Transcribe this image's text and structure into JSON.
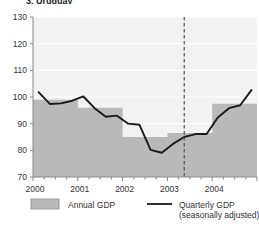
{
  "title": "3. Uruguay",
  "chart_data": {
    "type": "line",
    "title": "3. Uruguay",
    "xlabel": "",
    "ylabel": "",
    "ylim": [
      70,
      130
    ],
    "yticks": [
      70,
      80,
      90,
      100,
      110,
      120,
      130
    ],
    "ytick_labels": [
      "70",
      "80",
      "90",
      "100",
      "110",
      "120",
      "130"
    ],
    "xlim": [
      "2000Q1",
      "2004Q4"
    ],
    "xticks": [
      "2000",
      "2001",
      "2002",
      "2003",
      "2004"
    ],
    "xtick_labels": [
      "2000",
      "2001",
      "2002",
      "2003",
      "2004"
    ],
    "grid": true,
    "legend_position": "bottom",
    "annotations": [
      {
        "type": "vline",
        "style": "dashed",
        "x": "2003Q2",
        "label": ""
      }
    ],
    "series": [
      {
        "name": "Annual GDP",
        "type": "step-area",
        "color": "#b9b9b9",
        "categories": [
          "2000",
          "2001",
          "2002",
          "2003",
          "2004"
        ],
        "values": [
          99.0,
          96.0,
          85.0,
          86.5,
          97.5
        ]
      },
      {
        "name": "Quarterly GDP (seasonally adjusted)",
        "type": "line",
        "color": "#1a1a1a",
        "x": [
          "2000Q1",
          "2000Q2",
          "2000Q3",
          "2000Q4",
          "2001Q1",
          "2001Q2",
          "2001Q3",
          "2001Q4",
          "2002Q1",
          "2002Q2",
          "2002Q3",
          "2002Q4",
          "2003Q1",
          "2003Q2",
          "2003Q3",
          "2003Q4",
          "2004Q1",
          "2004Q2",
          "2004Q3",
          "2004Q4"
        ],
        "values": [
          101.8,
          97.4,
          97.6,
          98.6,
          100.2,
          95.8,
          92.6,
          93.0,
          90.0,
          89.6,
          80.2,
          79.1,
          82.4,
          85.0,
          86.1,
          86.1,
          92.3,
          95.8,
          96.9,
          102.6
        ]
      }
    ]
  },
  "legend": {
    "annual_label": "Annual GDP",
    "quarterly_label": "Quarterly GDP",
    "quarterly_sublabel": "(seasonally adjusted)"
  },
  "colors": {
    "bar_fill": "#b9b9b9",
    "line": "#1a1a1a",
    "plot_bg": "#f2f2f2",
    "grid": "#ffffff",
    "axis": "#888888",
    "text": "#333333"
  }
}
